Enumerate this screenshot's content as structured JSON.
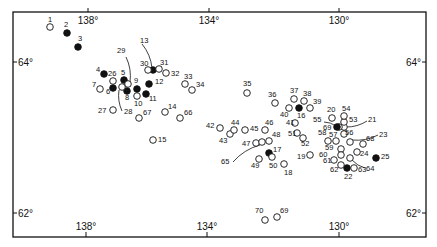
{
  "map": {
    "frame": {
      "left": 13,
      "top": 12,
      "right": 426,
      "bottom": 237
    },
    "colors": {
      "ink": "#111111",
      "background": "#ffffff"
    },
    "axis_labels": {
      "top": [
        {
          "text": "138°",
          "x": 88
        },
        {
          "text": "134°",
          "x": 209
        },
        {
          "text": "130°",
          "x": 339
        }
      ],
      "bottom": [
        {
          "text": "138°",
          "x": 86
        },
        {
          "text": "134°",
          "x": 207
        },
        {
          "text": "130°",
          "x": 339
        }
      ],
      "left": [
        {
          "text": "64°",
          "y": 62
        },
        {
          "text": "62°",
          "y": 213
        }
      ],
      "right": [
        {
          "text": "64°",
          "y": 62
        },
        {
          "text": "62°",
          "y": 213
        }
      ]
    },
    "stations": [
      {
        "id": "1",
        "x": 50,
        "y": 27,
        "filled": false,
        "lx": 48,
        "ly": 22
      },
      {
        "id": "2",
        "x": 67,
        "y": 33,
        "filled": true,
        "lx": 64,
        "ly": 27
      },
      {
        "id": "3",
        "x": 78,
        "y": 47,
        "filled": true,
        "lx": 78,
        "ly": 41
      },
      {
        "id": "4",
        "x": 104,
        "y": 74,
        "filled": true,
        "lx": 96,
        "ly": 72
      },
      {
        "id": "5",
        "x": 124,
        "y": 80,
        "filled": true,
        "lx": 121,
        "ly": 75
      },
      {
        "id": "6",
        "x": 113,
        "y": 88,
        "filled": true,
        "lx": 106,
        "ly": 94
      },
      {
        "id": "7",
        "x": 100,
        "y": 89,
        "filled": false,
        "lx": 92,
        "ly": 87
      },
      {
        "id": "8",
        "x": 127,
        "y": 91,
        "filled": true,
        "lx": 125,
        "ly": 100
      },
      {
        "id": "9",
        "x": 137,
        "y": 89,
        "filled": true,
        "lx": 134,
        "ly": 83
      },
      {
        "id": "10",
        "x": 137,
        "y": 96,
        "filled": false,
        "lx": 134,
        "ly": 106
      },
      {
        "id": "11",
        "x": 146,
        "y": 94,
        "filled": true,
        "lx": 149,
        "ly": 101
      },
      {
        "id": "12",
        "x": 149,
        "y": 84,
        "filled": true,
        "lx": 155,
        "ly": 84
      },
      {
        "id": "13",
        "x": 153,
        "y": 70,
        "filled": true,
        "lx": 140,
        "ly": 43,
        "leader": [
          142,
          44,
          152,
          68
        ]
      },
      {
        "id": "14",
        "x": 165,
        "y": 112,
        "filled": false,
        "lx": 168,
        "ly": 109
      },
      {
        "id": "15",
        "x": 153,
        "y": 140,
        "filled": false,
        "lx": 158,
        "ly": 142
      },
      {
        "id": "16",
        "x": 299,
        "y": 108,
        "filled": true,
        "lx": 297,
        "ly": 118
      },
      {
        "id": "17",
        "x": 269,
        "y": 153,
        "filled": true,
        "lx": 273,
        "ly": 152
      },
      {
        "id": "18",
        "x": 284,
        "y": 164,
        "filled": false,
        "lx": 284,
        "ly": 175
      },
      {
        "id": "19",
        "x": 310,
        "y": 155,
        "filled": false,
        "lx": 297,
        "ly": 159
      },
      {
        "id": "20",
        "x": 332,
        "y": 118,
        "filled": false,
        "lx": 327,
        "ly": 112
      },
      {
        "id": "21",
        "x": 344,
        "y": 127,
        "filled": false,
        "lx": 368,
        "ly": 122,
        "leader": [
          367,
          121,
          346,
          127
        ]
      },
      {
        "id": "22",
        "x": 347,
        "y": 168,
        "filled": true,
        "lx": 344,
        "ly": 179
      },
      {
        "id": "23",
        "x": 350,
        "y": 142,
        "filled": false,
        "lx": 379,
        "ly": 137,
        "leader": [
          378,
          135,
          352,
          140
        ]
      },
      {
        "id": "24",
        "x": 357,
        "y": 152,
        "filled": false,
        "lx": 360,
        "ly": 156
      },
      {
        "id": "25",
        "x": 376,
        "y": 158,
        "filled": true,
        "lx": 381,
        "ly": 159
      },
      {
        "id": "26",
        "x": 113,
        "y": 81,
        "filled": false,
        "lx": 108,
        "ly": 76
      },
      {
        "id": "27",
        "x": 113,
        "y": 110,
        "filled": false,
        "lx": 98,
        "ly": 113
      },
      {
        "id": "28",
        "x": 122,
        "y": 87,
        "filled": false,
        "lx": 124,
        "ly": 114,
        "leader": [
          122,
          111,
          119,
          90
        ]
      },
      {
        "id": "29",
        "x": 128,
        "y": 84,
        "filled": false,
        "lx": 117,
        "ly": 53,
        "leader": [
          126,
          57,
          130,
          82
        ]
      },
      {
        "id": "30",
        "x": 148,
        "y": 70,
        "filled": false,
        "lx": 140,
        "ly": 66
      },
      {
        "id": "31",
        "x": 159,
        "y": 69,
        "filled": false,
        "lx": 160,
        "ly": 65
      },
      {
        "id": "32",
        "x": 166,
        "y": 73,
        "filled": false,
        "lx": 171,
        "ly": 76
      },
      {
        "id": "33",
        "x": 185,
        "y": 84,
        "filled": false,
        "lx": 184,
        "ly": 79
      },
      {
        "id": "34",
        "x": 192,
        "y": 90,
        "filled": false,
        "lx": 196,
        "ly": 87
      },
      {
        "id": "35",
        "x": 247,
        "y": 93,
        "filled": false,
        "lx": 243,
        "ly": 86
      },
      {
        "id": "36",
        "x": 275,
        "y": 103,
        "filled": false,
        "lx": 268,
        "ly": 97
      },
      {
        "id": "37",
        "x": 294,
        "y": 99,
        "filled": false,
        "lx": 290,
        "ly": 93
      },
      {
        "id": "38",
        "x": 304,
        "y": 101,
        "filled": false,
        "lx": 303,
        "ly": 96
      },
      {
        "id": "39",
        "x": 310,
        "y": 108,
        "filled": false,
        "lx": 313,
        "ly": 104
      },
      {
        "id": "40",
        "x": 289,
        "y": 108,
        "filled": false,
        "lx": 280,
        "ly": 117
      },
      {
        "id": "41",
        "x": 295,
        "y": 123,
        "filled": false,
        "lx": 286,
        "ly": 125
      },
      {
        "id": "42",
        "x": 220,
        "y": 128,
        "filled": false,
        "lx": 206,
        "ly": 128
      },
      {
        "id": "43",
        "x": 230,
        "y": 134,
        "filled": false,
        "lx": 219,
        "ly": 143
      },
      {
        "id": "44",
        "x": 234,
        "y": 130,
        "filled": false,
        "lx": 231,
        "ly": 125
      },
      {
        "id": "45",
        "x": 245,
        "y": 130,
        "filled": false,
        "lx": 250,
        "ly": 131
      },
      {
        "id": "46",
        "x": 265,
        "y": 130,
        "filled": false,
        "lx": 265,
        "ly": 125
      },
      {
        "id": "47",
        "x": 256,
        "y": 143,
        "filled": false,
        "lx": 242,
        "ly": 146
      },
      {
        "id": "48",
        "x": 269,
        "y": 141,
        "filled": false,
        "lx": 272,
        "ly": 137
      },
      {
        "id": "49",
        "x": 259,
        "y": 159,
        "filled": false,
        "lx": 251,
        "ly": 168
      },
      {
        "id": "50",
        "x": 272,
        "y": 157,
        "filled": false,
        "lx": 269,
        "ly": 168
      },
      {
        "id": "51",
        "x": 297,
        "y": 133,
        "filled": false,
        "lx": 288,
        "ly": 136
      },
      {
        "id": "52",
        "x": 303,
        "y": 138,
        "filled": false,
        "lx": 301,
        "ly": 146
      },
      {
        "id": "53",
        "x": 344,
        "y": 122,
        "filled": false,
        "lx": 349,
        "ly": 122
      },
      {
        "id": "54",
        "x": 344,
        "y": 116,
        "filled": false,
        "lx": 342,
        "ly": 111
      },
      {
        "id": "55",
        "x": 339,
        "y": 127,
        "filled": false,
        "lx": 313,
        "ly": 122,
        "leader": [
          324,
          122,
          336,
          126
        ]
      },
      {
        "id": "56",
        "x": 344,
        "y": 134,
        "filled": false,
        "lx": 345,
        "ly": 135
      },
      {
        "id": "57",
        "x": 336,
        "y": 141,
        "filled": false,
        "lx": 329,
        "ly": 137
      },
      {
        "id": "58",
        "x": 328,
        "y": 141,
        "filled": false,
        "lx": 318,
        "ly": 135
      },
      {
        "id": "59",
        "x": 341,
        "y": 149,
        "filled": false,
        "lx": 325,
        "ly": 150
      },
      {
        "id": "60",
        "x": 341,
        "y": 155,
        "filled": false,
        "lx": 319,
        "ly": 157
      },
      {
        "id": "61",
        "x": 334,
        "y": 160,
        "filled": false,
        "lx": 323,
        "ly": 163
      },
      {
        "id": "62",
        "x": 341,
        "y": 165,
        "filled": false,
        "lx": 330,
        "ly": 172
      },
      {
        "id": "63",
        "x": 354,
        "y": 168,
        "filled": false,
        "lx": 358,
        "ly": 172
      },
      {
        "id": "64",
        "x": 350,
        "y": 158,
        "filled": false,
        "lx": 366,
        "ly": 171,
        "leader": [
          365,
          168,
          352,
          160
        ]
      },
      {
        "id": "65",
        "x": 262,
        "y": 142,
        "filled": false,
        "lx": 221,
        "ly": 164,
        "leader": [
          233,
          162,
          260,
          145
        ]
      },
      {
        "id": "66",
        "x": 180,
        "y": 118,
        "filled": false,
        "lx": 184,
        "ly": 115
      },
      {
        "id": "67",
        "x": 139,
        "y": 118,
        "filled": false,
        "lx": 143,
        "ly": 115
      },
      {
        "id": "68",
        "x": 363,
        "y": 144,
        "filled": false,
        "lx": 366,
        "ly": 141
      },
      {
        "id": "69",
        "x": 337,
        "y": 127,
        "filled": true,
        "lx": 323,
        "ly": 130
      },
      {
        "id": "70",
        "x": 265,
        "y": 220,
        "filled": false,
        "lx": 255,
        "ly": 213
      },
      {
        "id": "69b",
        "display": "69",
        "x": 277,
        "y": 217,
        "filled": false,
        "lx": 280,
        "ly": 213
      }
    ]
  }
}
